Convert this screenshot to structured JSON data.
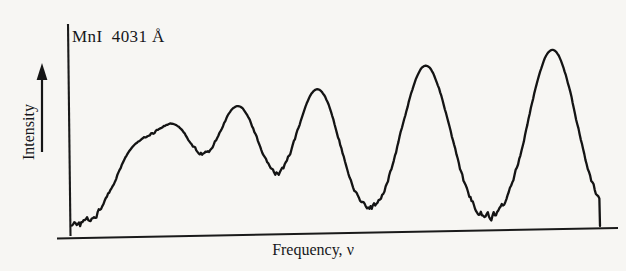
{
  "figure": {
    "sample_label": "MnI  4031 Å",
    "y_axis_label": "Intensity",
    "x_axis_label_text": "Frequency, ",
    "x_axis_symbol": "ν",
    "line_color": "#141414",
    "axis_color": "#1a1a1a",
    "background_color": "#f7f6f3"
  },
  "chart_data": {
    "type": "line",
    "title": "MnI  4031 Å",
    "xlabel": "Frequency, ν",
    "ylabel": "Intensity",
    "grid": false,
    "legend": false,
    "axis_ticks": false,
    "xlim": [
      0,
      100
    ],
    "ylim": [
      0,
      100
    ],
    "peaks": [
      {
        "index": 1,
        "center": 11.5,
        "height": 38,
        "width": 5.2
      },
      {
        "index": 2,
        "center": 19.5,
        "height": 51,
        "width": 5.6
      },
      {
        "index": 3,
        "center": 31.5,
        "height": 64,
        "width": 6.0
      },
      {
        "index": 4,
        "center": 46.5,
        "height": 73,
        "width": 6.0
      },
      {
        "index": 5,
        "center": 67.0,
        "height": 85,
        "width": 6.4
      },
      {
        "index": 6,
        "center": 91.0,
        "height": 93,
        "width": 6.4
      }
    ],
    "baseline": 4,
    "noise_amplitude": 2.2,
    "series": [
      {
        "name": "Mn I 4031 Å intensity trace",
        "x": [
          0,
          11.5,
          19.5,
          31.5,
          46.5,
          67.0,
          91.0,
          100
        ],
        "values": [
          4,
          38,
          51,
          64,
          73,
          85,
          93,
          4
        ]
      }
    ]
  }
}
